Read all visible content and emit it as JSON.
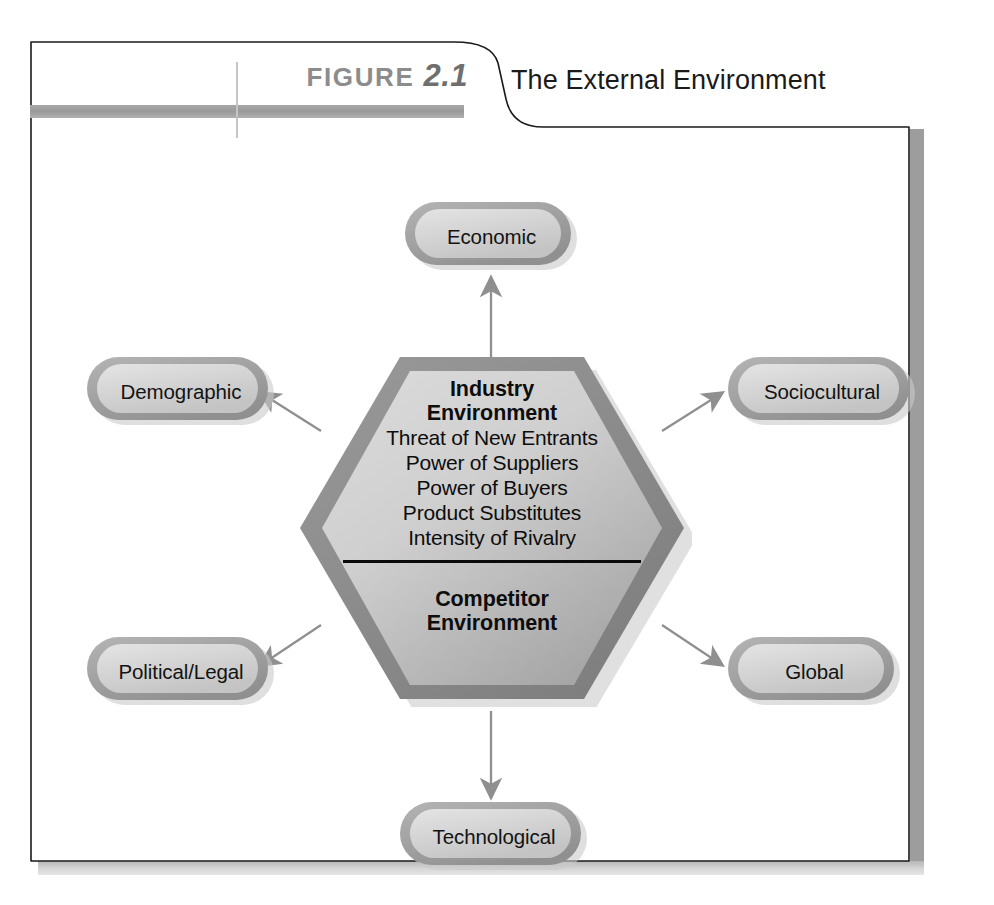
{
  "figure": {
    "label_word": "FIGURE",
    "label_number": "2.1",
    "title": "The External Environment"
  },
  "diagram": {
    "type": "radial-hexagon",
    "center": {
      "name": "industry-and-competitor-environment",
      "heading": "Industry\nEnvironment",
      "heading_line1": "Industry",
      "heading_line2": "Environment",
      "forces": [
        "Threat of New Entrants",
        "Power of Suppliers",
        "Power of Buyers",
        "Product Substitutes",
        "Intensity of Rivalry"
      ],
      "subheading_line1": "Competitor",
      "subheading_line2": "Environment"
    },
    "segments": [
      {
        "id": "economic",
        "label": "Economic",
        "position": "top",
        "arrow": "arrow-up-icon"
      },
      {
        "id": "sociocultural",
        "label": "Sociocultural",
        "position": "top-right",
        "arrow": "arrow-up-right-icon"
      },
      {
        "id": "global",
        "label": "Global",
        "position": "bottom-right",
        "arrow": "arrow-down-right-icon"
      },
      {
        "id": "technological",
        "label": "Technological",
        "position": "bottom",
        "arrow": "arrow-down-icon"
      },
      {
        "id": "political-legal",
        "label": "Political/Legal",
        "position": "bottom-left",
        "arrow": "arrow-down-left-icon"
      },
      {
        "id": "demographic",
        "label": "Demographic",
        "position": "top-left",
        "arrow": "arrow-up-left-icon"
      }
    ]
  },
  "colors": {
    "label_gray": "#8c8c8c",
    "rule_gray": "#9a9a9a",
    "hex_border": "#8d8d8d",
    "hex_fill_light": "#d5d5d5",
    "hex_fill_dark": "#a8a8a8",
    "pill_border": "#a9a9a9",
    "pill_fill": "#dcdcdc",
    "arrow_gray": "#8f8f8f",
    "frame_black": "#111111",
    "text_black": "#0d0d0d"
  }
}
